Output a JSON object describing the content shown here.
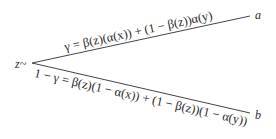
{
  "diagram": {
    "type": "branching-tree",
    "root": {
      "label": "z~"
    },
    "branches": [
      {
        "target_label": "a",
        "edge_label": "γ = β(z)(α(x)) + (1 − β(z))α(y)",
        "position": "upper"
      },
      {
        "target_label": "b",
        "edge_label": "1 − γ = β(z)(1 − α(x)) + (1 − β(z))(1 − α(y))",
        "position": "lower"
      }
    ],
    "line_color": "#444444",
    "text_color": "#2a2a2a"
  }
}
